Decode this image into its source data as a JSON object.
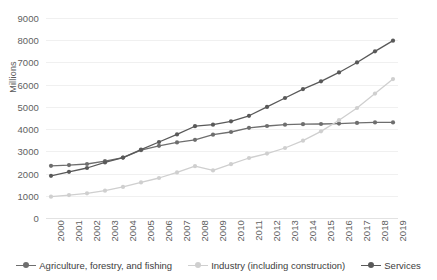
{
  "chart_data": {
    "type": "line",
    "title": "",
    "xlabel": "",
    "ylabel": "Millions",
    "ylim": [
      0,
      9000
    ],
    "ytick_step": 1000,
    "grid": true,
    "legend_position": "bottom",
    "categories": [
      "2000",
      "2001",
      "2002",
      "2003",
      "2004",
      "2005",
      "2006",
      "2007",
      "2008",
      "2009",
      "2010",
      "2011",
      "2012",
      "2013",
      "2014",
      "2015",
      "2016",
      "2017",
      "2018",
      "2019"
    ],
    "yticks": [
      "0",
      "1000",
      "2000",
      "3000",
      "4000",
      "5000",
      "6000",
      "7000",
      "8000",
      "9000"
    ],
    "series": [
      {
        "name": "Agriculture, forestry, and fishing",
        "color": "#6e6e6e",
        "marker": "circle",
        "values": [
          2350,
          2380,
          2430,
          2560,
          2720,
          3050,
          3250,
          3400,
          3520,
          3750,
          3870,
          4060,
          4140,
          4200,
          4220,
          4230,
          4250,
          4280,
          4300,
          4300
        ]
      },
      {
        "name": "Industry (including construction)",
        "color": "#cfcfcf",
        "marker": "circle",
        "values": [
          960,
          1030,
          1110,
          1230,
          1400,
          1600,
          1800,
          2050,
          2330,
          2140,
          2420,
          2700,
          2900,
          3150,
          3480,
          3900,
          4400,
          4950,
          5600,
          6250
        ]
      },
      {
        "name": "Services",
        "color": "#595959",
        "marker": "circle",
        "values": [
          1900,
          2080,
          2250,
          2500,
          2720,
          3080,
          3420,
          3760,
          4130,
          4200,
          4350,
          4600,
          5000,
          5400,
          5800,
          6150,
          6550,
          7000,
          7500,
          7980
        ]
      }
    ]
  },
  "legend": {
    "items": [
      {
        "label": "Agriculture, forestry, and fishing"
      },
      {
        "label": "Industry (including construction)"
      },
      {
        "label": "Services"
      }
    ]
  }
}
